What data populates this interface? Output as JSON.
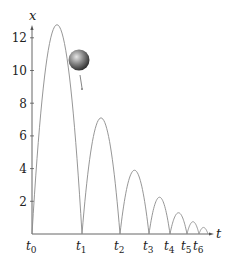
{
  "chart_data": {
    "type": "line",
    "title": "",
    "xlabel": "t",
    "ylabel": "x",
    "y_ticks": [
      2,
      4,
      6,
      8,
      10,
      12
    ],
    "ylim": [
      0,
      13.2
    ],
    "x_tick_labels": [
      "t0",
      "t1",
      "t2",
      "t3",
      "t4",
      "t5",
      "t6"
    ],
    "bounce_times_px": [
      32,
      82,
      120,
      149,
      170,
      187,
      199,
      208
    ],
    "series": [
      {
        "name": "x(t)",
        "arcs": [
          {
            "start": "t0",
            "end": "t1",
            "peak": 12.8
          },
          {
            "start": "t1",
            "end": "t2",
            "peak": 7.1
          },
          {
            "start": "t2",
            "end": "t3",
            "peak": 3.9
          },
          {
            "start": "t3",
            "end": "t4",
            "peak": 2.25
          },
          {
            "start": "t4",
            "end": "t5",
            "peak": 1.3
          },
          {
            "start": "t5",
            "end": "t6",
            "peak": 0.75
          },
          {
            "start": "t6",
            "end": "",
            "peak": 0.4
          }
        ]
      }
    ],
    "annotations": [
      "ball with downward velocity arrow near first descent"
    ],
    "grid": false,
    "legend": null
  },
  "colors": {
    "curve": "#8a8a8a",
    "axis": "#555555",
    "ball_light": "#d8d8d8",
    "ball_dark": "#2a2a2a"
  },
  "labels": {
    "x_axis": "t",
    "y_axis": "x",
    "y_ticks": [
      "2",
      "4",
      "6",
      "8",
      "10",
      "12"
    ],
    "t_ticks": [
      "t",
      "t",
      "t",
      "t",
      "t",
      "t",
      "t"
    ],
    "t_subs": [
      "0",
      "1",
      "2",
      "3",
      "4",
      "5",
      "6"
    ]
  }
}
